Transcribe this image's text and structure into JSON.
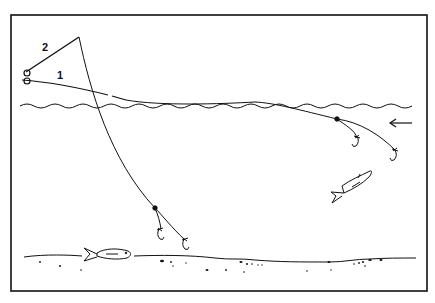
{
  "diagram": {
    "type": "illustration",
    "labels": {
      "line_1": "1",
      "line_2": "2"
    },
    "elements": [
      {
        "id": "rod-2",
        "description": "rod line labeled 2 angled upward then line descending deep"
      },
      {
        "id": "line-1",
        "description": "line labeled 1 trailing along water surface"
      },
      {
        "id": "water-surface",
        "description": "wavy water surface line"
      },
      {
        "id": "current-arrow",
        "description": "arrow pointing left indicating current"
      },
      {
        "id": "shallow-rig",
        "description": "two-hook rig near surface with weight bead"
      },
      {
        "id": "deep-rig",
        "description": "two-hook rig near bottom with weight bead"
      },
      {
        "id": "fish-midwater",
        "description": "fish swimming upward in mid water"
      },
      {
        "id": "fish-bottom",
        "description": "fish near the bottom"
      },
      {
        "id": "bottom",
        "description": "river/sea bottom with pebbles"
      }
    ],
    "colors": {
      "ink": "#111111",
      "background": "#ffffff"
    }
  }
}
